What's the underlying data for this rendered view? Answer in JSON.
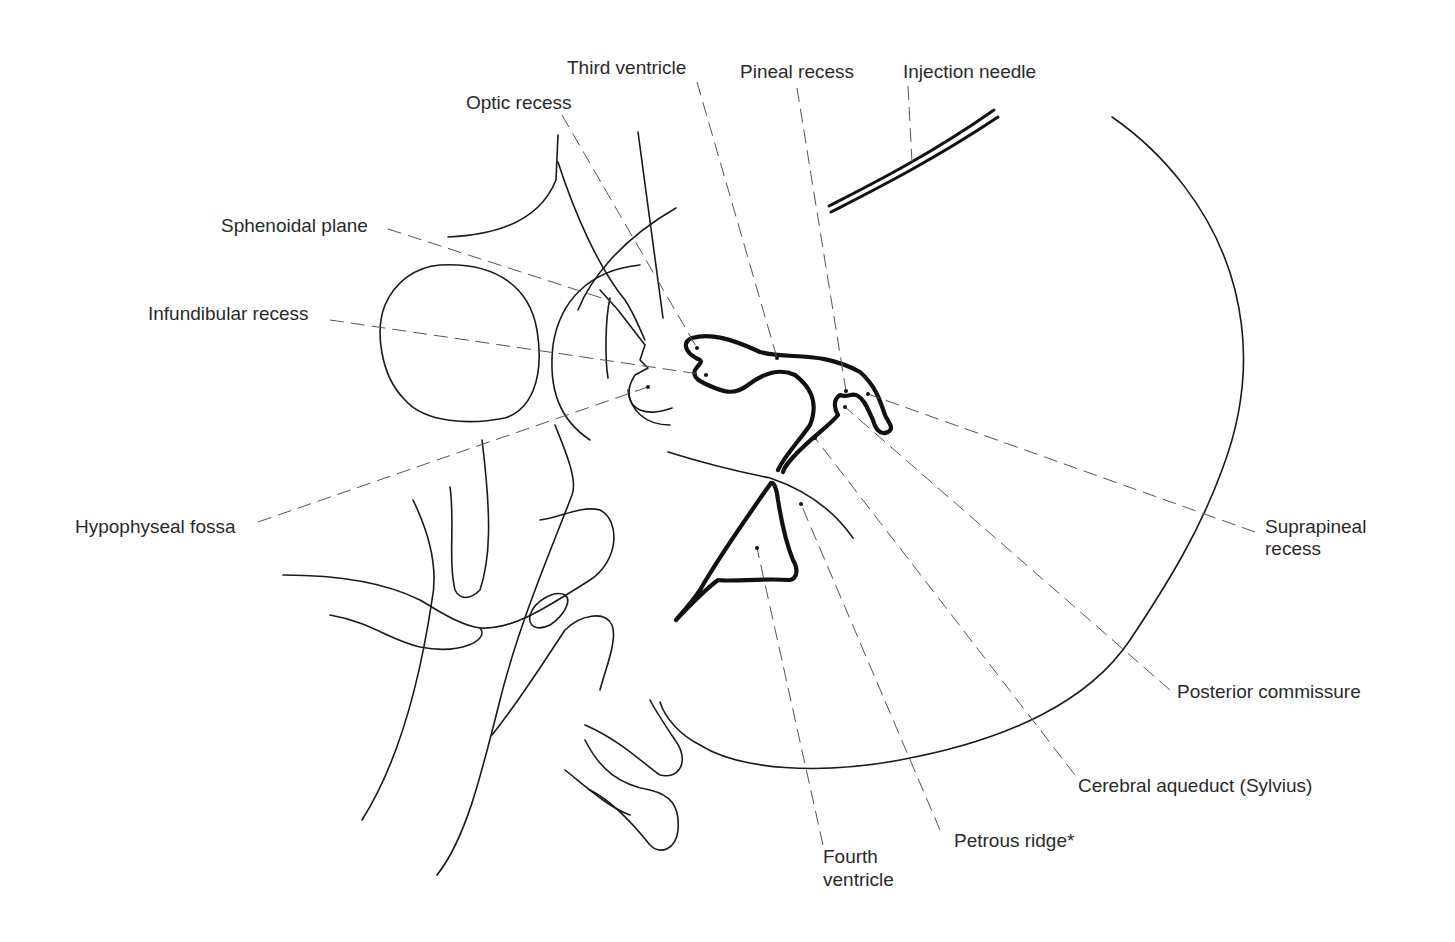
{
  "figure": {
    "colors": {
      "line": "#1a1a1a",
      "leader": "#555555",
      "background": "#ffffff"
    }
  },
  "labels": {
    "third_ventricle": "Third ventricle",
    "pineal_recess": "Pineal recess",
    "injection_needle": "Injection needle",
    "optic_recess": "Optic recess",
    "sphenoidal_plane": "Sphenoidal plane",
    "infundibular_recess": "Infundibular recess",
    "hypophyseal_fossa": "Hypophyseal fossa",
    "suprapineal_recess_line1": "Suprapineal",
    "suprapineal_recess_line2": "recess",
    "posterior_commissure": "Posterior commissure",
    "cerebral_aqueduct": "Cerebral aqueduct (Sylvius)",
    "petrous_ridge": "Petrous ridge*",
    "fourth_ventricle_line1": "Fourth",
    "fourth_ventricle_line2": "ventricle"
  }
}
